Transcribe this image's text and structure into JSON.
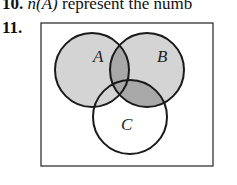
{
  "header": {
    "question_number": "10.",
    "text_italic": "n(A)",
    "text_rest": " represent the numb"
  },
  "question": {
    "number": "11."
  },
  "diagram": {
    "type": "venn",
    "sets": [
      {
        "label": "A",
        "shaded": true
      },
      {
        "label": "B",
        "shaded": true
      },
      {
        "label": "C",
        "shaded": false
      }
    ],
    "regions": {
      "A_only": "light",
      "B_only": "light",
      "A_and_B_only": "dark",
      "B_and_C_only": "dark",
      "A_and_C_only": "light",
      "A_and_B_and_C": "dark",
      "C_only": "none"
    },
    "colors": {
      "light": "#d4d4d4",
      "dark": "#a8a8a8",
      "stroke": "#1a1a1a",
      "border": "#333333"
    }
  }
}
